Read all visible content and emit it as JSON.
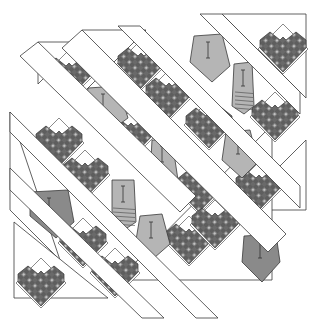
{
  "colors": {
    "background": "#ffffff",
    "outline": "#3a3a3a",
    "heart_dark": "#5a5a5a",
    "heart_mid": "#7a7a7a",
    "heart_light": "#b8b8b8",
    "tie_light": "#b5b5b5",
    "tie_dark": "#8a8a8a",
    "tie_striped": "#9a9a9a"
  },
  "strips": [
    {
      "points": "38,42 196,196 180,212 20,56"
    },
    {
      "points": "82,30 286,234 268,252 62,48"
    },
    {
      "points": "140,26 300,186 300,208 118,26"
    },
    {
      "points": "222,14 300,92 300,114 200,14"
    },
    {
      "points": "10,112 218,318 196,318 10,132"
    },
    {
      "points": "10,168 164,318 142,318 10,190"
    }
  ],
  "triangles": [
    {
      "points": "38,42 80,42 38,84"
    },
    {
      "points": "82,30 146,30 82,94"
    },
    {
      "points": "222,14 306,14 306,98"
    },
    {
      "points": "306,140 306,210 236,210"
    },
    {
      "points": "10,112 10,210 60,260"
    },
    {
      "points": "14,222 14,298 108,298"
    },
    {
      "points": "118,280 272,280 272,125"
    }
  ],
  "hearts": [
    {
      "x": 46,
      "y": 58,
      "s": 1
    },
    {
      "x": 118,
      "y": 48,
      "s": 1
    },
    {
      "x": 260,
      "y": 32,
      "s": 1
    },
    {
      "x": 146,
      "y": 78,
      "s": 1
    },
    {
      "x": 36,
      "y": 126,
      "s": 1
    },
    {
      "x": 108,
      "y": 118,
      "s": 1
    },
    {
      "x": 252,
      "y": 100,
      "s": 1
    },
    {
      "x": 186,
      "y": 108,
      "s": 1
    },
    {
      "x": 62,
      "y": 158,
      "s": 1
    },
    {
      "x": 176,
      "y": 172,
      "s": 1
    },
    {
      "x": 236,
      "y": 170,
      "s": 1
    },
    {
      "x": 60,
      "y": 226,
      "s": 1
    },
    {
      "x": 92,
      "y": 256,
      "s": 1
    },
    {
      "x": 166,
      "y": 224,
      "s": 1
    },
    {
      "x": 192,
      "y": 208,
      "s": 1
    },
    {
      "x": 18,
      "y": 266,
      "s": 1
    }
  ],
  "ties": [
    {
      "type": "wide",
      "shade": "light",
      "points": "88,88 118,86 128,118 106,134 84,112"
    },
    {
      "type": "wide",
      "shade": "light",
      "points": "194,36 222,34 230,66 212,82 190,62"
    },
    {
      "type": "narrow-striped",
      "shade": "light",
      "points": "234,64 252,62 254,106 244,114 232,106",
      "stripes": true
    },
    {
      "type": "narrow",
      "shade": "light",
      "points": "152,140 172,140 178,180 164,192 150,178"
    },
    {
      "type": "wide",
      "shade": "light",
      "points": "226,132 250,130 258,162 242,178 222,160"
    },
    {
      "type": "narrow-striped",
      "shade": "light",
      "points": "112,180 134,180 136,222 124,230 112,222",
      "stripes": true
    },
    {
      "type": "wide",
      "shade": "dark",
      "points": "30,192 68,190 74,222 56,238 30,216"
    },
    {
      "type": "wide",
      "shade": "light",
      "points": "140,216 162,214 170,244 154,258 136,240"
    },
    {
      "type": "wide",
      "shade": "dark",
      "points": "244,236 276,234 280,262 262,282 242,262"
    }
  ]
}
